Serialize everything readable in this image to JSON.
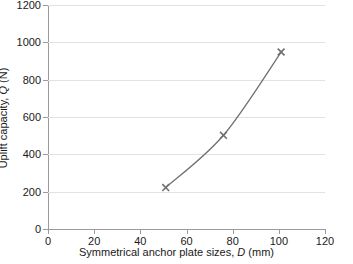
{
  "chart_data": {
    "type": "line",
    "title": "",
    "xlabel": "Symmetrical anchor plate sizes, D (mm)",
    "ylabel": "Uplift capacity, Q (N)",
    "xlabel_parts": {
      "text_before": "Symmetrical anchor plate sizes, ",
      "italic": "D",
      "text_after": " (mm)"
    },
    "ylabel_parts": {
      "text_before": "Uplift capacity, ",
      "italic": "Q",
      "text_after": " (N)"
    },
    "xlim": [
      0,
      120
    ],
    "ylim": [
      0,
      1200
    ],
    "xticks": [
      0,
      20,
      40,
      60,
      80,
      100,
      120
    ],
    "yticks": [
      0,
      200,
      400,
      600,
      800,
      1000,
      1200
    ],
    "xtick_labels": [
      "0",
      "20",
      "40",
      "60",
      "80",
      "100",
      "120"
    ],
    "ytick_labels": [
      "0",
      "200",
      "400",
      "600",
      "800",
      "1000",
      "1200"
    ],
    "grid": {
      "horizontal": true,
      "vertical": false,
      "color": "#e2e2e2"
    },
    "legend": {
      "visible": false,
      "position": "none"
    },
    "series": [
      {
        "name": "Uplift capacity",
        "marker": "x-cross",
        "marker_color": "#707070",
        "line_color": "#707070",
        "line_style": "solid",
        "x": [
          51,
          76,
          101
        ],
        "y": [
          222,
          502,
          948
        ],
        "points": [
          {
            "x": 51,
            "y": 222
          },
          {
            "x": 76,
            "y": 502
          },
          {
            "x": 101,
            "y": 948
          }
        ]
      }
    ],
    "axis_color": "#9a9a9a",
    "background": "#ffffff"
  }
}
